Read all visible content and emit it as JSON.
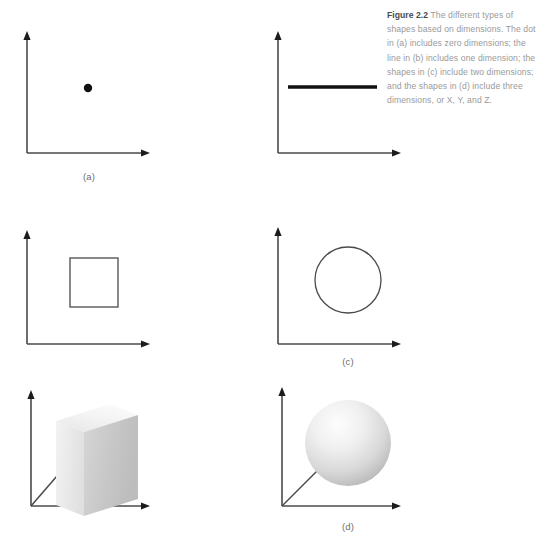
{
  "figure": {
    "label": "Figure 2.2",
    "caption_body": "The different types of shapes based on dimensions. The dot in (a) includes zero dimensions; the line in (b) includes one dimension; the shapes in (c) include two dimensions; and the shapes in (d) include three dimensions, or X, Y, and Z."
  },
  "colors": {
    "axis": "#4a4a4a",
    "shape_stroke": "#4a4a4a",
    "dot_fill": "#111111",
    "line_fill": "#111111",
    "caption_label": "#4a4a4a",
    "caption_body": "#9a9a9a",
    "panel_label": "#6e6e6e",
    "cube_front": "#ededed",
    "cube_top": "#f4f4f4",
    "cube_side": "#c9c9c9",
    "sphere_light": "#fbfbfb",
    "sphere_dark": "#b4b4b4",
    "background": "#ffffff"
  },
  "panels": [
    {
      "id": "a",
      "label": "(a)",
      "dimensions": 0,
      "shape": "dot",
      "axes": [
        "x",
        "y"
      ],
      "dot": {
        "cx": 88,
        "cy": 88,
        "r": 4.2
      }
    },
    {
      "id": "b",
      "label": "(b)",
      "dimensions": 1,
      "shape": "line",
      "axes": [
        "x",
        "y"
      ],
      "line": {
        "x1": 288,
        "y1": 87,
        "x2": 377,
        "y2": 87,
        "thickness": 3.4
      }
    },
    {
      "id": "c",
      "label": "(c)",
      "dimensions": 2,
      "shapes": [
        "square",
        "circle"
      ],
      "axes": [
        "x",
        "y"
      ],
      "square": {
        "x": 70,
        "y": 258,
        "width": 48,
        "height": 49
      },
      "circle": {
        "cx": 348,
        "cy": 280,
        "r": 33
      }
    },
    {
      "id": "d",
      "label": "(d)",
      "dimensions": 3,
      "shapes": [
        "cube",
        "sphere"
      ],
      "axes": [
        "x",
        "y",
        "z"
      ],
      "axis_names": [
        "X",
        "Y",
        "Z"
      ],
      "cube": {
        "x": 56,
        "y": 404,
        "width": 82,
        "height": 88
      },
      "sphere": {
        "cx": 348,
        "cy": 443,
        "r": 43
      }
    }
  ]
}
